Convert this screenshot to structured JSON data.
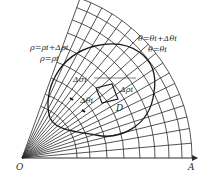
{
  "figure": {
    "type": "polar-grid-diagram",
    "origin_label": "O",
    "axis_label": "A",
    "labels": {
      "rho_outer": "ρ=ρi+Δρi",
      "rho_inner": "ρ=ρi",
      "theta_outer": "θ=θi+Δθi",
      "theta_inner": "θ=θi",
      "delta_sigma": "Δσi",
      "delta_theta": "Δθi",
      "delta_rho": "Δρi",
      "region": "D"
    },
    "geometry": {
      "origin": [
        22,
        158
      ],
      "axis_end": [
        197,
        158
      ],
      "arc_radii": [
        55,
        68,
        85,
        102,
        118,
        133,
        147,
        160,
        170
      ],
      "ray_angles_deg": [
        0,
        5,
        10,
        14,
        18,
        22,
        26,
        30,
        34,
        38,
        42,
        46,
        50,
        54,
        58,
        62,
        66,
        70
      ],
      "line_color": "#2a2a2a"
    }
  }
}
